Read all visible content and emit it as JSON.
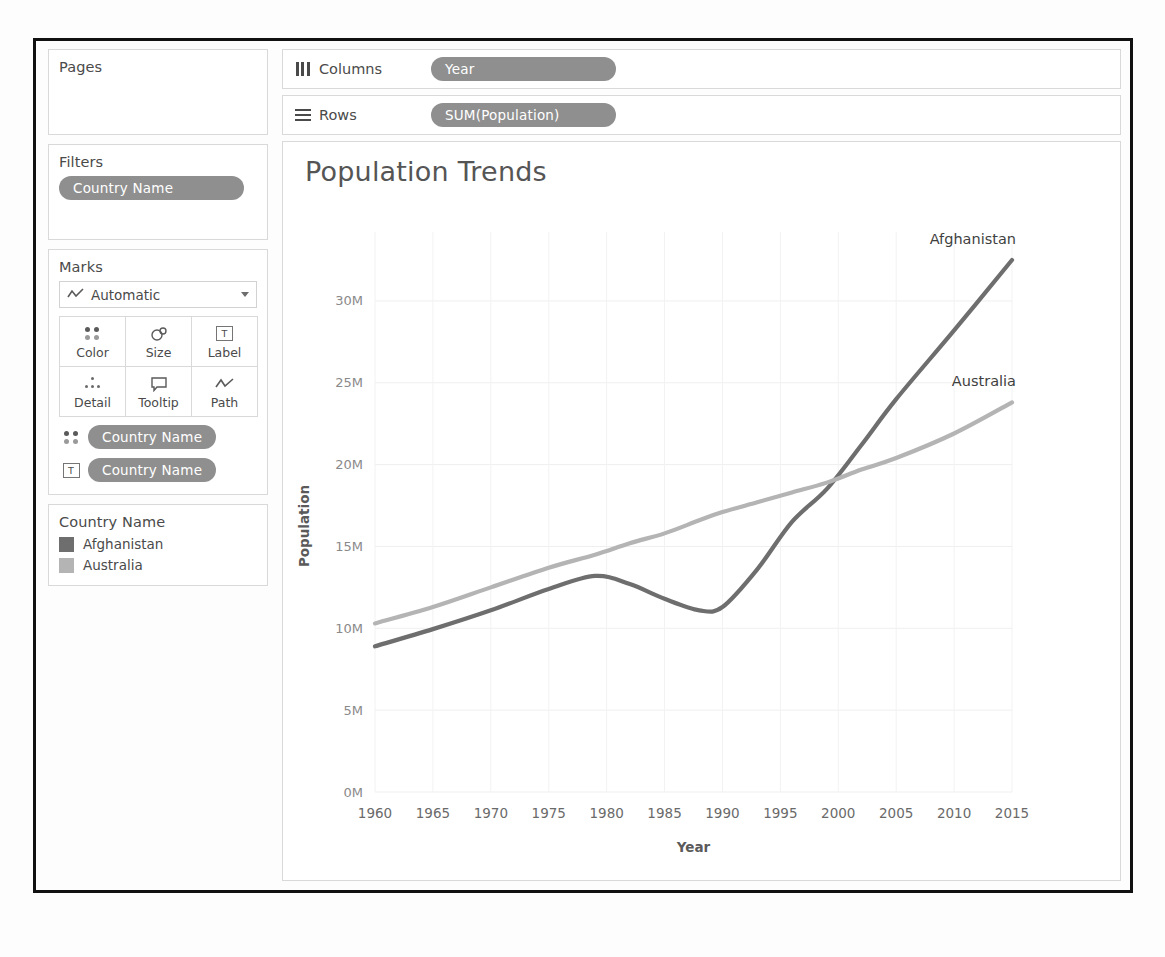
{
  "left_panel": {
    "pages": {
      "title": "Pages"
    },
    "filters": {
      "title": "Filters",
      "pills": [
        "Country Name"
      ]
    },
    "marks": {
      "title": "Marks",
      "mark_type": "Automatic",
      "mark_type_icon": "line-chart-icon",
      "buttons": [
        {
          "label": "Color",
          "icon": "color-dots-icon"
        },
        {
          "label": "Size",
          "icon": "size-circles-icon"
        },
        {
          "label": "Label",
          "icon": "label-t-icon"
        },
        {
          "label": "Detail",
          "icon": "detail-dots-icon"
        },
        {
          "label": "Tooltip",
          "icon": "tooltip-bubble-icon"
        },
        {
          "label": "Path",
          "icon": "path-line-icon"
        }
      ],
      "encodings": [
        {
          "icon": "color-dots-icon",
          "field": "Country Name"
        },
        {
          "icon": "label-t-icon",
          "field": "Country Name"
        }
      ]
    },
    "legend": {
      "title": "Country Name",
      "entries": [
        {
          "label": "Afghanistan",
          "color": "#6e6e6e"
        },
        {
          "label": "Australia",
          "color": "#b4b4b4"
        }
      ]
    }
  },
  "shelves": [
    {
      "icon": "columns-icon",
      "label": "Columns",
      "pills": [
        "Year"
      ]
    },
    {
      "icon": "rows-icon",
      "label": "Rows",
      "pills": [
        "SUM(Population)"
      ]
    }
  ],
  "chart_data": {
    "type": "line",
    "title": "Population Trends",
    "xlabel": "Year",
    "ylabel": "Population",
    "xlim": [
      1960,
      2015
    ],
    "ylim": [
      0,
      32500000
    ],
    "grid": true,
    "legend_position": "right-endpoint-labels",
    "xticks": [
      1960,
      1965,
      1970,
      1975,
      1980,
      1985,
      1990,
      1995,
      2000,
      2005,
      2010,
      2015
    ],
    "xtick_labels": [
      "1960",
      "1965",
      "1970",
      "1975",
      "1980",
      "1985",
      "1990",
      "1995",
      "2000",
      "2005",
      "2010",
      "2015"
    ],
    "yticks": [
      0,
      5000000,
      10000000,
      15000000,
      20000000,
      25000000,
      30000000
    ],
    "ytick_labels": [
      "0M",
      "5M",
      "10M",
      "15M",
      "20M",
      "25M",
      "30M"
    ],
    "annotations": [
      {
        "text": "Afghanistan",
        "x": 2015,
        "y": 32500000
      },
      {
        "text": "Australia",
        "x": 2015,
        "y": 23800000
      }
    ],
    "x": [
      1960,
      1965,
      1970,
      1975,
      1979,
      1982,
      1985,
      1988,
      1990,
      1993,
      1996,
      1999,
      2002,
      2005,
      2010,
      2015
    ],
    "series": [
      {
        "name": "Afghanistan",
        "color": "#6e6e6e",
        "values": [
          8900000,
          9950000,
          11100000,
          12400000,
          13200000,
          12700000,
          11800000,
          11100000,
          11300000,
          13600000,
          16500000,
          18500000,
          21200000,
          24000000,
          28200000,
          32500000
        ]
      },
      {
        "name": "Australia",
        "color": "#b4b4b4",
        "values": [
          10300000,
          11300000,
          12500000,
          13700000,
          14500000,
          15200000,
          15800000,
          16600000,
          17100000,
          17700000,
          18300000,
          18900000,
          19700000,
          20400000,
          21900000,
          23800000
        ]
      }
    ]
  }
}
